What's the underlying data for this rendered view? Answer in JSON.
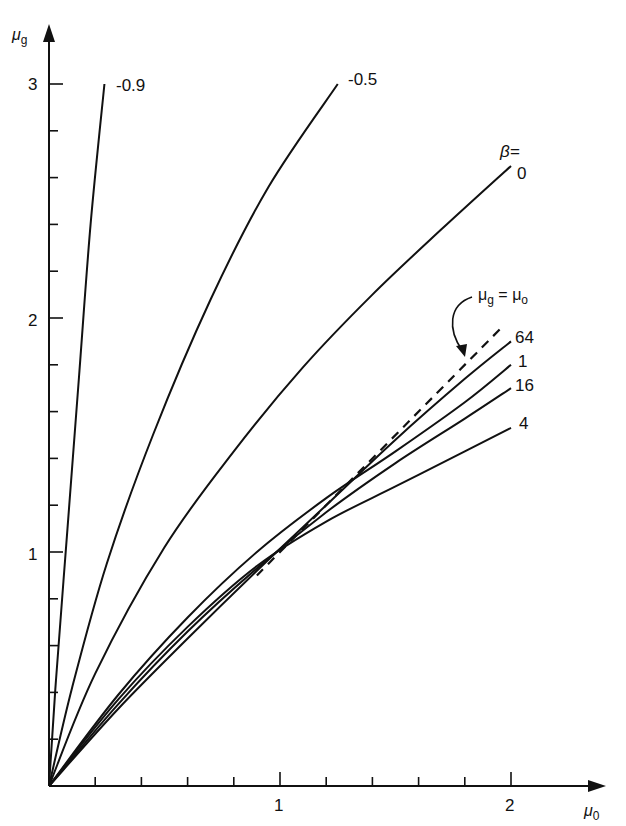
{
  "chart_data": {
    "type": "line",
    "title": "",
    "xlabel": "μ0",
    "ylabel": "μg",
    "xlim": [
      0,
      2.3
    ],
    "ylim": [
      0,
      3.2
    ],
    "grid": false,
    "x_ticks": [
      {
        "value": 1,
        "label": "1"
      },
      {
        "value": 2,
        "label": "2"
      }
    ],
    "x_minor_step": 0.2,
    "y_ticks": [
      {
        "value": 1,
        "label": "1"
      },
      {
        "value": 2,
        "label": "2"
      },
      {
        "value": 3,
        "label": "3"
      }
    ],
    "y_minor_step": 0.2,
    "legend_header": "β=",
    "series": [
      {
        "name": "-0.9",
        "label": "-0.9",
        "style": "solid",
        "x": [
          0,
          0.03,
          0.08,
          0.13,
          0.18,
          0.24
        ],
        "y": [
          0,
          0.45,
          1.1,
          1.75,
          2.4,
          3.0
        ]
      },
      {
        "name": "-0.5",
        "label": "-0.5",
        "style": "solid",
        "x": [
          0,
          0.1,
          0.25,
          0.45,
          0.7,
          0.95,
          1.25
        ],
        "y": [
          0,
          0.42,
          0.95,
          1.5,
          2.08,
          2.56,
          3.0
        ]
      },
      {
        "name": "0",
        "label": "0",
        "style": "solid",
        "x": [
          0,
          0.2,
          0.5,
          0.8,
          1.1,
          1.4,
          1.7,
          2.0
        ],
        "y": [
          0,
          0.48,
          1.02,
          1.43,
          1.79,
          2.1,
          2.38,
          2.65
        ]
      },
      {
        "name": "64",
        "label": "64",
        "style": "solid",
        "x": [
          0,
          0.3,
          0.6,
          0.9,
          1.2,
          1.5,
          1.8,
          2.0
        ],
        "y": [
          0,
          0.33,
          0.63,
          0.92,
          1.2,
          1.48,
          1.74,
          1.9
        ]
      },
      {
        "name": "1",
        "label": "1",
        "style": "solid",
        "x": [
          0,
          0.3,
          0.6,
          0.9,
          1.2,
          1.5,
          1.8,
          2.0
        ],
        "y": [
          0,
          0.39,
          0.72,
          1.0,
          1.23,
          1.43,
          1.64,
          1.8
        ]
      },
      {
        "name": "16",
        "label": "16",
        "style": "solid",
        "x": [
          0,
          0.3,
          0.6,
          0.9,
          1.2,
          1.5,
          1.8,
          2.0
        ],
        "y": [
          0,
          0.35,
          0.66,
          0.93,
          1.17,
          1.38,
          1.57,
          1.7
        ]
      },
      {
        "name": "4",
        "label": "4",
        "style": "solid",
        "x": [
          0,
          0.3,
          0.6,
          0.9,
          1.2,
          1.5,
          1.8,
          2.0
        ],
        "y": [
          0,
          0.37,
          0.68,
          0.94,
          1.13,
          1.28,
          1.43,
          1.53
        ]
      },
      {
        "name": "μg=μo",
        "label": "μg = μo",
        "style": "dashed",
        "x": [
          0.9,
          1.97
        ],
        "y": [
          0.9,
          1.97
        ]
      }
    ],
    "annotations": [
      {
        "text": "μg = μo",
        "points_to": "dashed line",
        "arrow": "curved"
      }
    ]
  },
  "labels": {
    "y_axis": "μ",
    "y_axis_sub": "g",
    "x_axis": "μ",
    "x_axis_sub": "0",
    "beta_header": "β=",
    "identity_mu": "μ",
    "identity_g": "g",
    "identity_eq": " = ",
    "identity_o": "o"
  }
}
